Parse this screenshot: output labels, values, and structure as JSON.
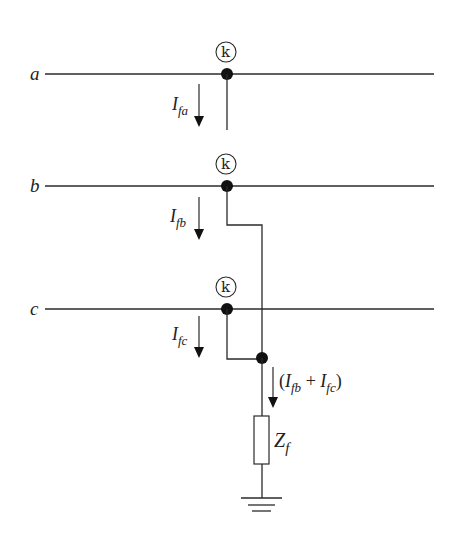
{
  "diagram": {
    "phases": [
      {
        "id": "a",
        "label": "a",
        "y": 74,
        "fault_marker": "k",
        "current_main": "I",
        "current_sub": "fa"
      },
      {
        "id": "b",
        "label": "b",
        "y": 186,
        "fault_marker": "k",
        "current_main": "I",
        "current_sub": "fb"
      },
      {
        "id": "c",
        "label": "c",
        "y": 309,
        "fault_marker": "k",
        "current_main": "I",
        "current_sub": "fc"
      }
    ],
    "fault_point_label": "k",
    "combined_current": {
      "open_paren": "(",
      "i1": "I",
      "s1": "fb",
      "plus": " + ",
      "i2": "I",
      "s2": "fc",
      "close_paren": ")"
    },
    "impedance": {
      "main": "Z",
      "sub": "f"
    },
    "ground_symbol": "ground",
    "colors": {
      "line": "#2a2a2a",
      "node": "#111111",
      "background": "#ffffff"
    }
  }
}
